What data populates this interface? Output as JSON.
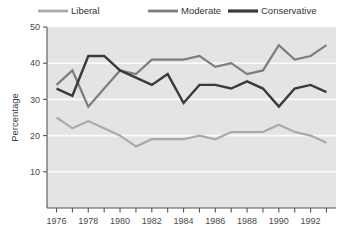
{
  "chart_data": {
    "type": "line",
    "title": "",
    "xlabel": "",
    "ylabel": "Percentage",
    "xlim": [
      1975.4,
      1993.6
    ],
    "ylim": [
      0,
      50
    ],
    "grid": true,
    "legend_position": "top",
    "y_ticks": [
      10,
      20,
      30,
      40,
      50
    ],
    "x_ticks": [
      1976,
      1977,
      1978,
      1979,
      1980,
      1981,
      1982,
      1983,
      1984,
      1985,
      1986,
      1987,
      1988,
      1989,
      1990,
      1991,
      1992,
      1993
    ],
    "x_tick_labels": [
      "1976",
      "",
      "1978",
      "",
      "1980",
      "",
      "1982",
      "",
      "1984",
      "",
      "1986",
      "",
      "1988",
      "",
      "1990",
      "",
      "1992",
      ""
    ],
    "x": [
      1976,
      1977,
      1978,
      1979,
      1980,
      1981,
      1982,
      1983,
      1984,
      1985,
      1986,
      1987,
      1988,
      1989,
      1990,
      1991,
      1992,
      1993
    ],
    "series": [
      {
        "name": "Liberal",
        "color": "#a9a9a9",
        "width": 2.2,
        "values": [
          25,
          22,
          24,
          22,
          20,
          17,
          19,
          19,
          19,
          20,
          19,
          21,
          21,
          21,
          23,
          21,
          20,
          18
        ]
      },
      {
        "name": "Moderate",
        "color": "#7d7d7d",
        "width": 2.2,
        "values": [
          34,
          38,
          28,
          33,
          38,
          37,
          41,
          41,
          41,
          42,
          39,
          40,
          37,
          38,
          45,
          41,
          42,
          45
        ]
      },
      {
        "name": "Conservative",
        "color": "#3a3a3a",
        "width": 2.4,
        "values": [
          33,
          31,
          42,
          42,
          38,
          36,
          34,
          37,
          29,
          34,
          34,
          33,
          35,
          33,
          28,
          33,
          34,
          32
        ]
      }
    ]
  },
  "legend": {
    "items": [
      {
        "label": "Liberal",
        "color": "#a9a9a9"
      },
      {
        "label": "Moderate",
        "color": "#7d7d7d"
      },
      {
        "label": "Conservative",
        "color": "#3a3a3a"
      }
    ]
  }
}
